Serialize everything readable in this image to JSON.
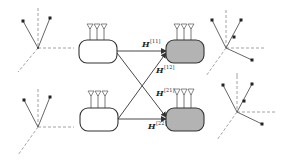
{
  "diagram": {
    "colors": {
      "stroke": "#333333",
      "receiver_fill": "#b3b3b3",
      "transmitter_fill": "#ffffff",
      "dashed_axis": "#8a8a8a",
      "background": "#ffffff"
    },
    "transmitters": [
      {
        "id": "tx1",
        "antennas": 3,
        "fill": "white"
      },
      {
        "id": "tx2",
        "antennas": 3,
        "fill": "white"
      }
    ],
    "receivers": [
      {
        "id": "rx1",
        "antennas": 3,
        "fill": "gray"
      },
      {
        "id": "rx2",
        "antennas": 3,
        "fill": "gray"
      }
    ],
    "channels": [
      {
        "from": "tx1",
        "to": "rx1",
        "symbol": "H",
        "superscript": "[11]"
      },
      {
        "from": "tx2",
        "to": "rx1",
        "symbol": "H",
        "superscript": "[12]"
      },
      {
        "from": "tx1",
        "to": "rx2",
        "symbol": "H",
        "superscript": "[21]"
      },
      {
        "from": "tx2",
        "to": "rx2",
        "symbol": "H",
        "superscript": "[22]"
      }
    ],
    "signal_space_frames": [
      {
        "side": "left",
        "position": "top",
        "vectors": 2
      },
      {
        "side": "left",
        "position": "bottom",
        "vectors": 2
      },
      {
        "side": "right",
        "position": "top",
        "vectors": 3
      },
      {
        "side": "right",
        "position": "bottom",
        "vectors": 3
      }
    ]
  }
}
